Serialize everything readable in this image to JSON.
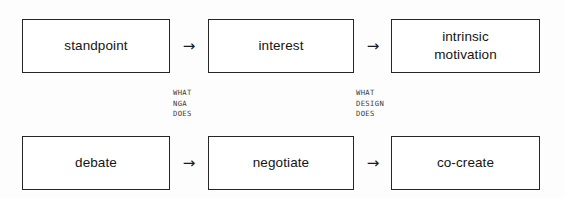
{
  "diagram": {
    "type": "two-row-flow",
    "rows": [
      {
        "name": "upper-row",
        "nodes": [
          {
            "label": "standpoint"
          },
          {
            "label": "interest"
          },
          {
            "label": "intrinsic\nmotivation"
          }
        ],
        "arrows": [
          {
            "glyph": "→"
          },
          {
            "glyph": "→"
          }
        ]
      },
      {
        "name": "lower-row",
        "nodes": [
          {
            "label": "debate"
          },
          {
            "label": "negotiate"
          },
          {
            "label": "co-create"
          }
        ],
        "arrows": [
          {
            "glyph": "→"
          },
          {
            "glyph": "→"
          }
        ]
      }
    ],
    "annotations": [
      {
        "name": "what-nga-does",
        "text": "WHAT\nNGA\nDOES"
      },
      {
        "name": "what-design-does",
        "text": "WHAT\nDESIGN\nDOES"
      }
    ],
    "colors": {
      "background": "#fdfdfd",
      "box_fill": "#ffffff",
      "box_border": "#262626",
      "label_text": "#141414",
      "annotation_text": "#3b3b3b",
      "arrow": "#1a1a1a"
    }
  }
}
